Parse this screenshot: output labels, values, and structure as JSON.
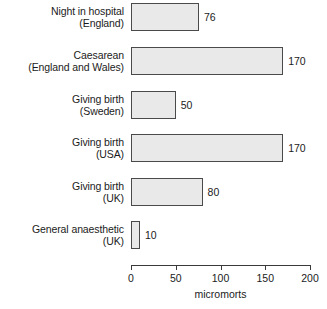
{
  "chart_data": {
    "type": "bar",
    "orientation": "horizontal",
    "title": "",
    "xlabel": "micromorts",
    "ylabel": "",
    "xlim": [
      0,
      200
    ],
    "grid": false,
    "legend": null,
    "xticks": [
      0,
      50,
      100,
      150,
      200
    ],
    "xtick_labels": [
      "0",
      "50",
      "100",
      "150",
      "200"
    ],
    "categories": [
      "Night in hospital (England)",
      "Caesarean (England and Wales)",
      "Giving birth (Sweden)",
      "Giving birth (USA)",
      "Giving birth (UK)",
      "General anaesthetic (UK)"
    ],
    "values": [
      76,
      170,
      50,
      170,
      80,
      10
    ],
    "value_labels": [
      "76",
      "170",
      "50",
      "170",
      "80",
      "10"
    ],
    "bars": [
      {
        "line1": "Night in hospital",
        "line2": "(England)",
        "value": 76,
        "label": "76"
      },
      {
        "line1": "Caesarean",
        "line2": "(England and Wales)",
        "value": 170,
        "label": "170"
      },
      {
        "line1": "Giving birth",
        "line2": "(Sweden)",
        "value": 50,
        "label": "50"
      },
      {
        "line1": "Giving birth",
        "line2": "(USA)",
        "value": 170,
        "label": "170"
      },
      {
        "line1": "Giving birth",
        "line2": "(UK)",
        "value": 80,
        "label": "80"
      },
      {
        "line1": "General anaesthetic",
        "line2": "(UK)",
        "value": 10,
        "label": "10"
      }
    ],
    "colors": {
      "bar_fill": "#e9e9e9",
      "bar_stroke": "#4a4a4a",
      "text": "#1b1b1b",
      "axis": "#3a3a3a",
      "background": "#ffffff"
    }
  }
}
